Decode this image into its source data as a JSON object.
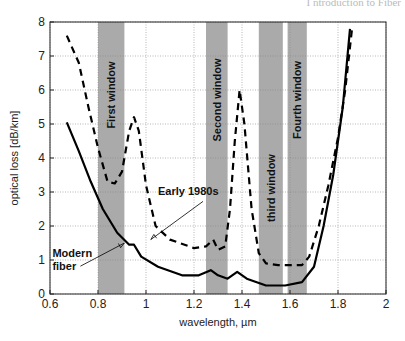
{
  "header_fragment": "I ntroduction to Fiber",
  "chart_data": {
    "type": "line",
    "title": "",
    "xlabel": "wavelength, µm",
    "ylabel": "optical loss [dB/km]",
    "xlim": [
      0.6,
      2
    ],
    "ylim": [
      0,
      8
    ],
    "xticks": [
      "0.6",
      "0.8",
      "1",
      "1.2",
      "1.4",
      "1.6",
      "1.8",
      "2"
    ],
    "yticks": [
      "0",
      "1",
      "2",
      "3",
      "4",
      "5",
      "6",
      "7",
      "8"
    ],
    "grid": true,
    "bands": [
      {
        "label": "First window",
        "from": 0.8,
        "to": 0.91,
        "color": "#aaaaaa"
      },
      {
        "label": "Second window",
        "from": 1.25,
        "to": 1.34,
        "color": "#aaaaaa"
      },
      {
        "label": "third window",
        "from": 1.47,
        "to": 1.57,
        "color": "#aaaaaa"
      },
      {
        "label": "Fourth window",
        "from": 1.59,
        "to": 1.67,
        "color": "#aaaaaa"
      }
    ],
    "series": [
      {
        "name": "Early 1980s",
        "style": "dashed",
        "x": [
          0.67,
          0.72,
          0.76,
          0.8,
          0.84,
          0.87,
          0.9,
          0.93,
          0.95,
          0.97,
          1.0,
          1.04,
          1.1,
          1.2,
          1.25,
          1.28,
          1.3,
          1.33,
          1.35,
          1.37,
          1.39,
          1.41,
          1.44,
          1.47,
          1.5,
          1.55,
          1.6,
          1.65,
          1.68,
          1.72,
          1.76,
          1.8,
          1.83,
          1.86
        ],
        "y": [
          7.6,
          6.8,
          5.5,
          4.3,
          3.3,
          3.25,
          3.6,
          4.8,
          5.2,
          4.8,
          3.2,
          2.0,
          1.6,
          1.35,
          1.4,
          1.6,
          1.3,
          1.4,
          2.5,
          4.5,
          6.0,
          5.0,
          2.5,
          1.2,
          0.9,
          0.85,
          0.85,
          0.85,
          1.1,
          2.0,
          3.2,
          4.6,
          6.0,
          7.9
        ]
      },
      {
        "name": "Modern fiber",
        "style": "solid",
        "x": [
          0.67,
          0.72,
          0.77,
          0.82,
          0.88,
          0.93,
          0.95,
          0.98,
          1.05,
          1.15,
          1.22,
          1.27,
          1.3,
          1.34,
          1.38,
          1.42,
          1.5,
          1.58,
          1.65,
          1.7,
          1.74,
          1.78,
          1.82,
          1.85
        ],
        "y": [
          5.05,
          4.2,
          3.3,
          2.5,
          1.8,
          1.45,
          1.45,
          1.1,
          0.8,
          0.55,
          0.55,
          0.7,
          0.55,
          0.45,
          0.65,
          0.45,
          0.25,
          0.25,
          0.35,
          0.8,
          2.0,
          3.5,
          5.5,
          7.8
        ]
      }
    ],
    "annotations": [
      {
        "text": "Early 1980s",
        "x": 1.05,
        "y": 2.9,
        "arrow_to": [
          1.02,
          1.6
        ]
      },
      {
        "text": "Modern",
        "x": 0.61,
        "y": 1.1
      },
      {
        "text": "fiber",
        "x": 0.61,
        "y": 0.7,
        "arrow_to": [
          0.91,
          1.5
        ]
      }
    ]
  }
}
